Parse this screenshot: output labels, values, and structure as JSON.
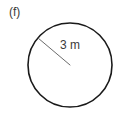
{
  "figure": {
    "part_label": "(f)",
    "shape_name": "circle",
    "background_color": "#ffffff",
    "stroke_color": "#1a1a1a",
    "text_color": "#3b3b3b"
  },
  "circle": {
    "center_x": 70,
    "center_y": 65,
    "radius_px": 42,
    "stroke_width": 1.6
  },
  "radius": {
    "label": "3 m",
    "value": 3,
    "unit": "m",
    "line_start_x": 38,
    "line_start_y": 38,
    "line_end_x": 70,
    "line_end_y": 65,
    "stroke_width": 1
  }
}
